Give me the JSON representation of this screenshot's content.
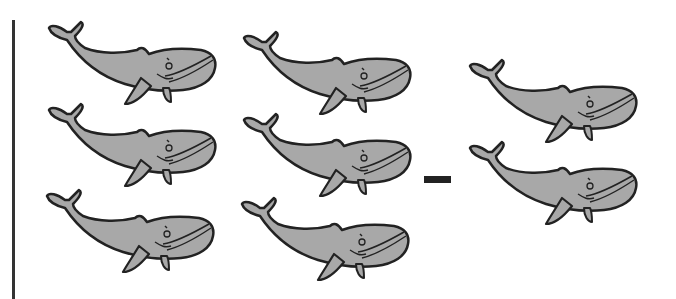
{
  "problem": {
    "description": "Subtraction picture problem: 6 whales minus 2 whales",
    "operator": "minus",
    "left_group": {
      "count": 6,
      "object": "whale",
      "layout": "2 columns x 3 rows"
    },
    "right_group": {
      "count": 2,
      "object": "whale",
      "layout": "1 column x 2 rows"
    }
  },
  "colors": {
    "whale_fill": "#a8a8a8",
    "outline": "#222222",
    "background": "#ffffff"
  },
  "whales": [
    {
      "x": 45,
      "y": 18
    },
    {
      "x": 45,
      "y": 100
    },
    {
      "x": 43,
      "y": 186
    },
    {
      "x": 240,
      "y": 28
    },
    {
      "x": 240,
      "y": 110
    },
    {
      "x": 238,
      "y": 194
    },
    {
      "x": 466,
      "y": 56
    },
    {
      "x": 466,
      "y": 138
    }
  ]
}
